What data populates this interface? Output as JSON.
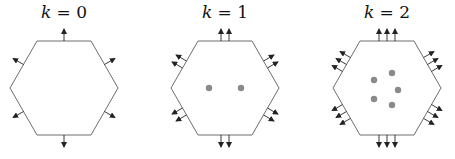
{
  "diagram": {
    "colors": {
      "edge": "#6e6e6e",
      "arrow": "#222222",
      "dot": "#8a8a8a"
    },
    "panels": [
      {
        "var": "k",
        "eq": "=",
        "value": "0",
        "cx": 64,
        "arrows_per_edge": 1,
        "dots": []
      },
      {
        "var": "k",
        "eq": "=",
        "value": "1",
        "cx": 225,
        "arrows_per_edge": 2,
        "dots": [
          [
            209,
            88
          ],
          [
            241,
            88
          ]
        ]
      },
      {
        "var": "k",
        "eq": "=",
        "value": "2",
        "cx": 387,
        "arrows_per_edge": 3,
        "dots": [
          [
            374,
            80
          ],
          [
            392,
            73
          ],
          [
            398,
            90
          ],
          [
            374,
            99
          ],
          [
            392,
            105
          ]
        ]
      }
    ]
  }
}
